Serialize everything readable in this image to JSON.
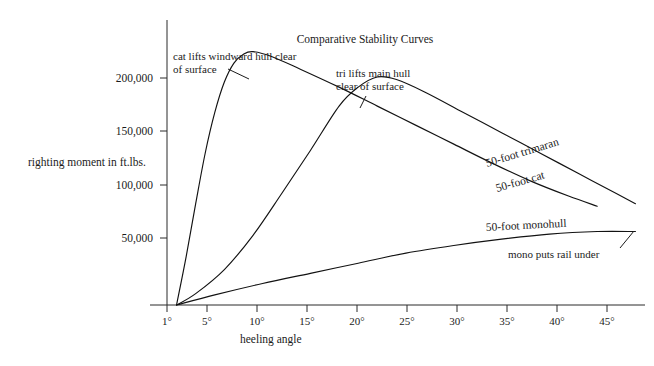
{
  "chart_data": {
    "type": "line",
    "title": "Comparative Stability Curves",
    "xlabel": "heeling angle",
    "ylabel": "righting moment in ft.lbs.",
    "grid": false,
    "legend_position": "inline-curve-labels",
    "xlim": [
      0,
      50
    ],
    "ylim": [
      0,
      225000
    ],
    "x_tick_labels": [
      "1°",
      "5°",
      "10°",
      "15°",
      "20°",
      "25°",
      "30°",
      "35°",
      "40°",
      "45°"
    ],
    "x_tick_values": [
      1,
      5,
      10,
      15,
      20,
      25,
      30,
      35,
      40,
      45
    ],
    "y_tick_labels": [
      "50,000",
      "100,000",
      "150,000",
      "200,000"
    ],
    "y_tick_values": [
      50000,
      100000,
      150000,
      200000
    ],
    "series": [
      {
        "name": "50-foot trimaran",
        "label": "50-foot trimaran",
        "x": [
          1,
          3,
          6,
          9,
          12,
          15,
          18,
          20,
          22,
          24,
          27,
          31,
          35,
          39,
          43,
          47,
          49
        ],
        "y": [
          0,
          9000,
          28000,
          55000,
          88000,
          122000,
          157000,
          172000,
          180000,
          178000,
          168000,
          152000,
          136000,
          120000,
          104000,
          88000,
          80000
        ]
      },
      {
        "name": "50-foot cat",
        "label": "50-foot cat",
        "x": [
          1,
          2,
          3,
          4,
          5,
          6,
          7,
          8,
          9,
          11,
          14,
          18,
          22,
          26,
          30,
          34,
          38,
          42,
          45
        ],
        "y": [
          0,
          38000,
          80000,
          120000,
          152000,
          176000,
          191000,
          198000,
          200000,
          196000,
          186000,
          172000,
          157000,
          142000,
          127000,
          112000,
          98000,
          86000,
          78000
        ]
      },
      {
        "name": "50-foot monohull",
        "label": "50-foot monohull",
        "x": [
          1,
          5,
          10,
          15,
          20,
          25,
          30,
          35,
          40,
          45,
          49
        ],
        "y": [
          0,
          8000,
          17000,
          25000,
          33000,
          41000,
          47000,
          52000,
          56000,
          58000,
          58000
        ]
      }
    ],
    "annotations": [
      {
        "id": "cat-lift-note",
        "text_line1": "cat lifts windward hull clear",
        "text_line2": "of surface",
        "target_series": "50-foot cat"
      },
      {
        "id": "tri-lift-note",
        "text_line1": "tri lifts main hull",
        "text_line2": "clear of surface",
        "target_series": "50-foot trimaran"
      },
      {
        "id": "mono-rail-note",
        "text_line1": "mono puts rail under",
        "text_line2": "",
        "target_series": "50-foot monohull"
      }
    ]
  }
}
